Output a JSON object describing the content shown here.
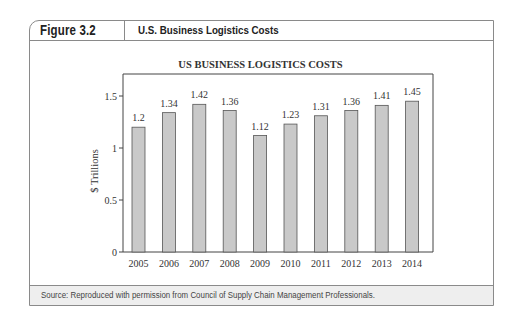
{
  "figure": {
    "number": "Figure 3.2",
    "title": "U.S. Business Logistics Costs",
    "source": "Source: Reproduced with permission from Council of Supply Chain Management Professionals."
  },
  "chart_data": {
    "type": "bar",
    "title": "US BUSINESS LOGISTICS COSTS",
    "xlabel": "",
    "ylabel": "$ Trillions",
    "categories": [
      "2005",
      "2006",
      "2007",
      "2008",
      "2009",
      "2010",
      "2011",
      "2012",
      "2013",
      "2014"
    ],
    "values": [
      1.2,
      1.34,
      1.42,
      1.36,
      1.12,
      1.23,
      1.31,
      1.36,
      1.41,
      1.45
    ],
    "data_labels": [
      "1.2",
      "1.34",
      "1.42",
      "1.36",
      "1.12",
      "1.23",
      "1.31",
      "1.36",
      "1.41",
      "1.45"
    ],
    "yticks": [
      0,
      0.5,
      1,
      1.5
    ],
    "ytick_labels": [
      "0",
      "0.5",
      "1",
      "1.5"
    ],
    "ylim": [
      0,
      1.71
    ],
    "grid": false,
    "legend": null,
    "colors": {
      "bar_fill": "#c9c9c9",
      "bar_edge": "#555555",
      "axis": "#444444"
    }
  }
}
